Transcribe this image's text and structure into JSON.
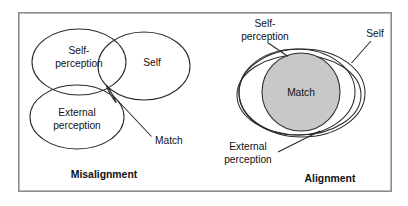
{
  "figure": {
    "background_color": "#ffffff",
    "frame_color": "#8c8c8c",
    "outline_color": "#2a2a2a",
    "match_fill_color": "#c8c8c8",
    "text_color": "#111111"
  },
  "panels": [
    {
      "id": "misalignment",
      "caption": "Misalignment",
      "shapes": [
        {
          "name": "self-perception-ellipse",
          "label": "Self-\nperception"
        },
        {
          "name": "self-ellipse",
          "label": "Self"
        },
        {
          "name": "external-perception-ellipse",
          "label": "External\nperception"
        },
        {
          "name": "match-region",
          "label": "Match",
          "filled": true
        }
      ],
      "labels": {
        "self_perception_line1": "Self-",
        "self_perception_line2": "perception",
        "self": "Self",
        "external_perception_line1": "External",
        "external_perception_line2": "perception",
        "match": "Match"
      }
    },
    {
      "id": "alignment",
      "caption": "Alignment",
      "shapes": [
        {
          "name": "self-perception-ellipse",
          "label": "Self-\nperception"
        },
        {
          "name": "self-ellipse",
          "label": "Self"
        },
        {
          "name": "external-perception-ellipse",
          "label": "External\nperception"
        },
        {
          "name": "match-region",
          "label": "Match",
          "filled": true
        }
      ],
      "labels": {
        "self_perception_line1": "Self-",
        "self_perception_line2": "perception",
        "self": "Self",
        "external_perception_line1": "External",
        "external_perception_line2": "perception",
        "match": "Match"
      }
    }
  ]
}
